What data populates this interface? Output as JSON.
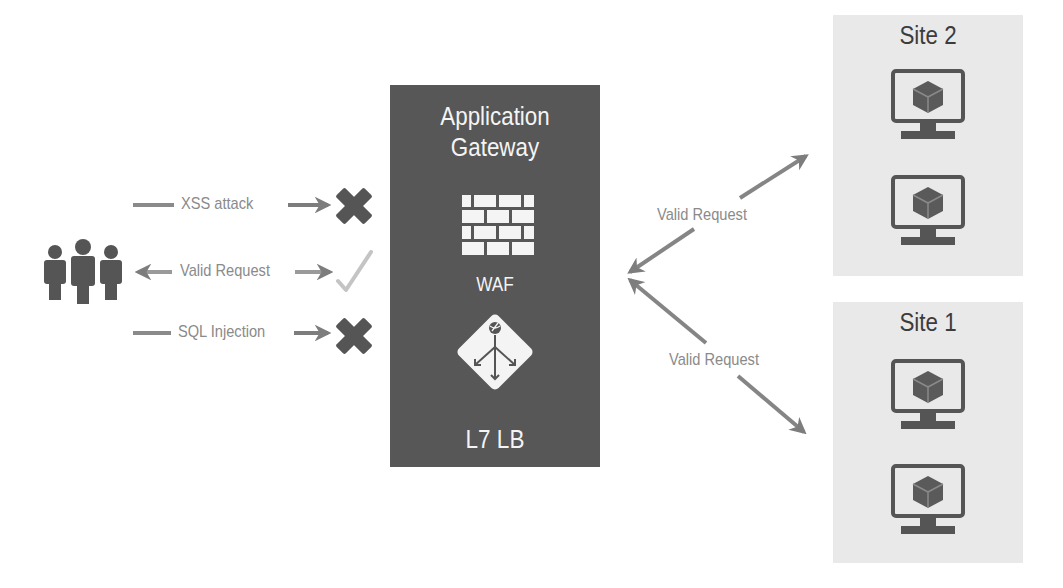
{
  "gateway": {
    "title_line1": "Application",
    "title_line2": "Gateway",
    "waf_label": "WAF",
    "lb_label": "L7 LB"
  },
  "client_flows": [
    {
      "label": "XSS attack",
      "direction": "to-gateway",
      "outcome": "blocked",
      "icon": "x-mark-icon"
    },
    {
      "label": "Valid Request",
      "direction": "bidirectional",
      "outcome": "allowed",
      "icon": "check-mark-icon"
    },
    {
      "label": "SQL Injection",
      "direction": "to-gateway",
      "outcome": "blocked",
      "icon": "x-mark-icon"
    }
  ],
  "backend_flows": [
    {
      "label": "Valid Request",
      "target": "Site 2"
    },
    {
      "label": "Valid Request",
      "target": "Site 1"
    }
  ],
  "sites": [
    {
      "title": "Site 2",
      "servers": 2
    },
    {
      "title": "Site 1",
      "servers": 2
    }
  ],
  "colors": {
    "gateway_bg": "#575757",
    "site_bg": "#e9e9e9",
    "arrow": "#8a8a8a",
    "icon_dark": "#555555",
    "check": "#c4c4c4"
  }
}
